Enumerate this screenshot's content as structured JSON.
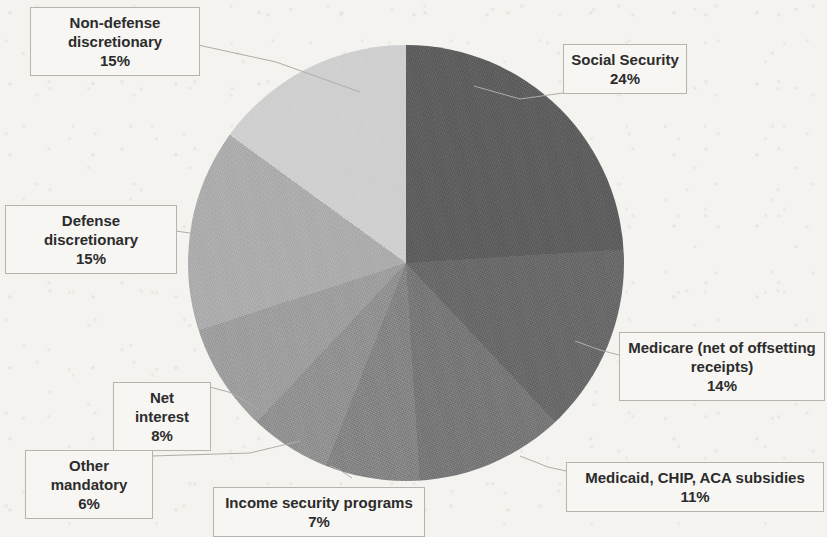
{
  "chart_data": {
    "type": "pie",
    "title": "",
    "subtitle": "",
    "legend_position": "callout-labels",
    "grid": false,
    "start_angle_deg": 0,
    "direction": "clockwise",
    "units": "percent of total",
    "total": 100,
    "center": {
      "x": 406,
      "y": 263,
      "radius": 218
    },
    "categories": [
      "Social Security",
      "Medicare (net of offsetting receipts)",
      "Medicaid, CHIP, ACA subsidies",
      "Income security programs",
      "Other mandatory",
      "Net interest",
      "Defense discretionary",
      "Non-defense discretionary"
    ],
    "values": [
      24,
      14,
      11,
      7,
      6,
      8,
      15,
      15
    ],
    "colors": [
      "#5b5b5b",
      "#666666",
      "#757575",
      "#828282",
      "#8f8f8f",
      "#9c9c9c",
      "#ababab",
      "#cfcfcf"
    ],
    "slices": [
      {
        "label": "Social Security",
        "value": 24,
        "value_text": "24%",
        "color": "#5b5b5b"
      },
      {
        "label": "Medicare (net of offsetting receipts)",
        "value": 14,
        "value_text": "14%",
        "color": "#666666"
      },
      {
        "label": "Medicaid, CHIP, ACA subsidies",
        "value": 11,
        "value_text": "11%",
        "color": "#757575"
      },
      {
        "label": "Income security programs",
        "value": 7,
        "value_text": "7%",
        "color": "#828282"
      },
      {
        "label": "Other mandatory",
        "value": 6,
        "value_text": "6%",
        "color": "#8f8f8f"
      },
      {
        "label": "Net interest",
        "value": 8,
        "value_text": "8%",
        "color": "#9c9c9c"
      },
      {
        "label": "Defense discretionary",
        "value": 15,
        "value_text": "15%",
        "color": "#ababab"
      },
      {
        "label": "Non-defense discretionary",
        "value": 15,
        "value_text": "15%",
        "color": "#cfcfcf"
      }
    ]
  },
  "labels": {
    "non_defense_discretionary": {
      "name": "Non-defense discretionary",
      "pct": "15%"
    },
    "defense_discretionary": {
      "name": "Defense discretionary",
      "pct": "15%"
    },
    "net_interest": {
      "name": "Net interest",
      "pct": "8%"
    },
    "other_mandatory": {
      "name": "Other mandatory",
      "pct": "6%"
    },
    "income_security_programs": {
      "name": "Income security programs",
      "pct": "7%"
    },
    "medicaid_chip_aca": {
      "name": "Medicaid, CHIP, ACA subsidies",
      "pct": "11%"
    },
    "medicare": {
      "name": "Medicare (net of offsetting receipts)",
      "pct": "14%"
    },
    "social_security": {
      "name": "Social Security",
      "pct": "24%"
    }
  },
  "page": {
    "background_color": "#f4f3f0",
    "label_box_fill": "#f7f6f3",
    "label_box_border": "#b7b4ad",
    "text_color": "#2c2c2c"
  }
}
